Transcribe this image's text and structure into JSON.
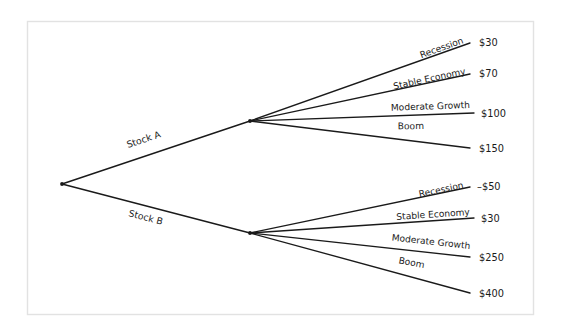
{
  "diagram": {
    "type": "decision-tree",
    "title": "",
    "frame": {
      "border_color": "#e2e2e2",
      "background": "#ffffff"
    },
    "line_color": "#1a1a1a",
    "root": {
      "label": ""
    },
    "decisions": [
      {
        "id": "stock-a",
        "label": "Stock A",
        "outcomes": [
          {
            "label": "Recession",
            "payoff": "$30"
          },
          {
            "label": "Stable Economy",
            "payoff": "$70"
          },
          {
            "label": "Moderate Growth",
            "payoff": "$100"
          },
          {
            "label": "Boom",
            "payoff": "$150"
          }
        ]
      },
      {
        "id": "stock-b",
        "label": "Stock B",
        "outcomes": [
          {
            "label": "Recession",
            "payoff": "–$50"
          },
          {
            "label": "Stable Economy",
            "payoff": "$30"
          },
          {
            "label": "Moderate Growth",
            "payoff": "$250"
          },
          {
            "label": "Boom",
            "payoff": "$400"
          }
        ]
      }
    ]
  }
}
